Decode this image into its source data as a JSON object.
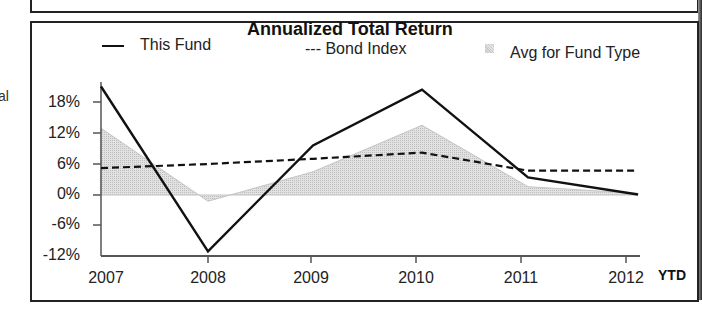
{
  "side_text": "al",
  "chart_data": {
    "type": "line",
    "title": "Annualized Total Return",
    "xlabel": "",
    "ylabel": "",
    "categories": [
      "2007",
      "2008",
      "2009",
      "2010",
      "2011",
      "2012"
    ],
    "x_suffix_label": "YTD",
    "yticks": [
      "18%",
      "12%",
      "6%",
      "0%",
      "-6%",
      "-12%"
    ],
    "ylim": [
      -12,
      22
    ],
    "grid": false,
    "legend_position": "top",
    "series": [
      {
        "name": "This Fund",
        "style": "solid",
        "color": "#111111",
        "legend_label": "This Fund",
        "values": [
          21.0,
          -10.9,
          9.6,
          20.4,
          3.4,
          0.1
        ]
      },
      {
        "name": "Bond Index",
        "style": "dashed",
        "color": "#111111",
        "legend_label": "--- Bond Index",
        "values": [
          5.2,
          6.0,
          7.0,
          8.2,
          4.7,
          4.7
        ]
      },
      {
        "name": "Avg for Fund Type",
        "style": "area",
        "color": "#d0d0d0",
        "legend_label": "Avg for Fund Type",
        "values": [
          12.9,
          -1.2,
          4.5,
          13.5,
          1.6,
          0.3
        ]
      }
    ]
  }
}
